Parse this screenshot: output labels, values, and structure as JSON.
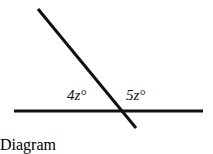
{
  "figure": {
    "type": "geometry-diagram",
    "background_color": "#ffffff",
    "stroke_color": "#111111",
    "canvas": {
      "width": 213,
      "height": 136
    }
  },
  "lines": {
    "horizontal": {
      "name": "horizontal-line",
      "x1": 14,
      "y1": 111,
      "x2": 203,
      "y2": 111,
      "stroke_width": 3
    },
    "transversal": {
      "name": "transversal-line",
      "x1": 38,
      "y1": 9,
      "x2": 136,
      "y2": 128,
      "stroke_width": 3
    }
  },
  "intersection": {
    "x": 117,
    "y": 111
  },
  "labels": {
    "left_angle": "4z°",
    "right_angle": "5z°"
  },
  "chart_data": {
    "type": "diagram",
    "title": "",
    "annotations": [
      "4z°",
      "5z°"
    ],
    "angle_expressions": [
      {
        "label": "4z°",
        "coefficient": 4,
        "variable": "z",
        "position": "left-of-intersection-above-horizontal"
      },
      {
        "label": "5z°",
        "coefficient": 5,
        "variable": "z",
        "position": "right-of-intersection-above-horizontal"
      }
    ]
  }
}
